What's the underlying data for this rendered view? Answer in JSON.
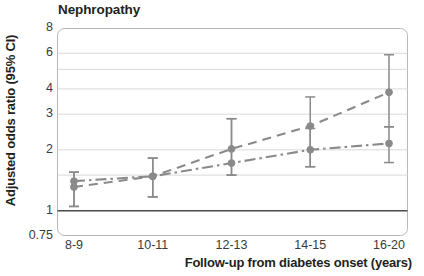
{
  "chart_data": {
    "type": "line",
    "title": "Nephropathy",
    "xlabel": "Follow-up from diabetes onset (years)",
    "ylabel": "Adjusted odds ratio (95% CI)",
    "categories": [
      "8-9",
      "10-11",
      "12-13",
      "14-15",
      "16-20"
    ],
    "yscale": "log",
    "ylim": [
      0.75,
      8
    ],
    "yticks": [
      0.75,
      1,
      2,
      3,
      4,
      6,
      8
    ],
    "ytick_labels": [
      "0.75",
      "1",
      "2",
      "3",
      "4",
      "6",
      "8"
    ],
    "gridlines": [
      1,
      1.5,
      2,
      3,
      4,
      5,
      6,
      8
    ],
    "grid": true,
    "legend_position": "none",
    "reference_line": 1,
    "annotations": [],
    "series": [
      {
        "name": "series-dashed",
        "linestyle": "dashed",
        "color": "#8a8a8a",
        "marker": "circle",
        "values": [
          1.31,
          1.48,
          2.02,
          2.62,
          3.85
        ],
        "ci_lower": [
          1.05,
          1.17,
          1.5,
          1.65,
          2.6
        ],
        "ci_upper": [
          1.55,
          1.82,
          2.85,
          3.65,
          5.9
        ]
      },
      {
        "name": "series-dash-dot",
        "linestyle": "dashdot",
        "color": "#8a8a8a",
        "marker": "circle",
        "values": [
          1.4,
          1.48,
          1.72,
          2.0,
          2.15
        ],
        "ci_lower": [
          1.05,
          1.17,
          1.5,
          1.65,
          1.73
        ],
        "ci_upper": [
          1.55,
          1.82,
          2.85,
          2.55,
          2.6
        ]
      }
    ]
  },
  "colors": {
    "line": "#8a8a8a",
    "marker": "#8a8a8a",
    "errorbar": "#8a8a8a",
    "grid": "#d9d9d9",
    "frame": "#b8b8b8",
    "reference_line": "#4d4d4d",
    "text": "#231f20",
    "tick_text": "#3b3b3b"
  }
}
